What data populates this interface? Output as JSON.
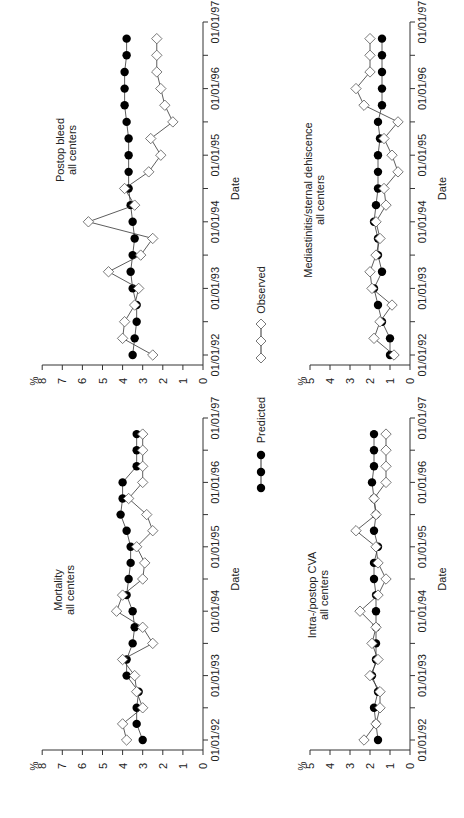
{
  "figure": {
    "orientation": "rotated-90-ccw",
    "legend": {
      "predicted_label": "Predicted",
      "observed_label": "Observed"
    },
    "xlabel": "Date",
    "ylabel": "%"
  },
  "chart_data": [
    {
      "type": "line",
      "title": "Postop bleed",
      "subtitle": "all centers",
      "xlabel": "Date",
      "ylabel": "%",
      "ylim": [
        0,
        8
      ],
      "yticks": [
        0,
        1,
        2,
        3,
        4,
        5,
        6,
        7,
        8
      ],
      "xticks": [
        "01/01/92",
        "01/01/93",
        "01/01/94",
        "01/01/95",
        "01/01/96",
        "01/01/97"
      ],
      "x": [
        "92Q1",
        "92Q2",
        "92Q3",
        "92Q4",
        "93Q1",
        "93Q2",
        "93Q3",
        "93Q4",
        "94Q1",
        "94Q2",
        "94Q3",
        "94Q4",
        "95Q1",
        "95Q2",
        "95Q3",
        "95Q4",
        "96Q1",
        "96Q2",
        "96Q3",
        "96Q4"
      ],
      "series": [
        {
          "name": "Predicted",
          "marker": "filled-circle",
          "values": [
            3.5,
            3.4,
            3.3,
            3.3,
            3.5,
            3.6,
            3.5,
            3.4,
            3.5,
            3.6,
            3.7,
            3.7,
            3.7,
            3.7,
            3.8,
            3.9,
            3.9,
            3.9,
            3.8,
            3.8
          ]
        },
        {
          "name": "Observed",
          "marker": "open-diamond",
          "values": [
            2.5,
            4.0,
            3.9,
            3.4,
            3.2,
            4.7,
            3.1,
            2.5,
            5.7,
            3.4,
            3.9,
            2.7,
            2.1,
            2.6,
            1.5,
            1.9,
            2.1,
            2.3,
            2.3,
            2.3
          ]
        }
      ]
    },
    {
      "type": "line",
      "title": "Mortality",
      "subtitle": "all centers",
      "xlabel": "Date",
      "ylabel": "%",
      "ylim": [
        0,
        8
      ],
      "yticks": [
        0,
        1,
        2,
        3,
        4,
        5,
        6,
        7,
        8
      ],
      "xticks": [
        "01/01/92",
        "01/01/93",
        "01/01/94",
        "01/01/95",
        "01/01/96",
        "01/01/97"
      ],
      "x": [
        "92Q1",
        "92Q2",
        "92Q3",
        "92Q4",
        "93Q1",
        "93Q2",
        "93Q3",
        "93Q4",
        "94Q1",
        "94Q2",
        "94Q3",
        "94Q4",
        "95Q1",
        "95Q2",
        "95Q3",
        "95Q4",
        "96Q1",
        "96Q2",
        "96Q3",
        "96Q4"
      ],
      "series": [
        {
          "name": "Predicted",
          "marker": "filled-circle",
          "values": [
            3.0,
            3.3,
            3.3,
            3.2,
            3.8,
            3.8,
            3.5,
            3.4,
            3.5,
            3.8,
            3.7,
            3.6,
            3.6,
            3.8,
            4.1,
            4.0,
            4.0,
            3.3,
            3.3,
            3.3
          ]
        },
        {
          "name": "Observed",
          "marker": "open-diamond",
          "values": [
            3.8,
            4.0,
            3.0,
            3.3,
            3.4,
            4.0,
            2.5,
            3.0,
            4.3,
            4.0,
            3.0,
            2.9,
            3.3,
            2.5,
            2.8,
            3.7,
            3.0,
            3.0,
            3.0,
            3.0
          ]
        }
      ]
    },
    {
      "type": "line",
      "title": "Mediastinitis/sternal dehiscence",
      "subtitle": "all centers",
      "xlabel": "Date",
      "ylabel": "%",
      "ylim": [
        0,
        5
      ],
      "yticks": [
        0,
        1,
        2,
        3,
        4,
        5
      ],
      "xticks": [
        "01/01/92",
        "01/01/93",
        "01/01/94",
        "01/01/95",
        "01/01/96",
        "01/01/97"
      ],
      "x": [
        "92Q1",
        "92Q2",
        "92Q3",
        "92Q4",
        "93Q1",
        "93Q2",
        "93Q3",
        "93Q4",
        "94Q1",
        "94Q2",
        "94Q3",
        "94Q4",
        "95Q1",
        "95Q2",
        "95Q3",
        "95Q4",
        "96Q1",
        "96Q2",
        "96Q3",
        "96Q4"
      ],
      "series": [
        {
          "name": "Predicted",
          "marker": "filled-circle",
          "values": [
            1.0,
            1.0,
            1.4,
            1.6,
            1.8,
            1.4,
            1.6,
            1.6,
            1.8,
            1.7,
            1.6,
            1.6,
            1.6,
            1.5,
            1.6,
            1.4,
            1.4,
            1.4,
            1.4,
            1.4
          ]
        },
        {
          "name": "Observed",
          "marker": "open-diamond",
          "values": [
            0.8,
            1.8,
            1.5,
            0.9,
            1.9,
            2.0,
            1.7,
            1.5,
            1.7,
            1.2,
            1.3,
            0.6,
            0.9,
            1.3,
            0.6,
            2.3,
            2.7,
            2.0,
            2.0,
            2.0
          ]
        }
      ]
    },
    {
      "type": "line",
      "title": "Intra-/postop CVA",
      "subtitle": "all centers",
      "xlabel": "Date",
      "ylabel": "%",
      "ylim": [
        0,
        5
      ],
      "yticks": [
        0,
        1,
        2,
        3,
        4,
        5
      ],
      "xticks": [
        "01/01/92",
        "01/01/93",
        "01/01/94",
        "01/01/95",
        "01/01/96",
        "01/01/97"
      ],
      "x": [
        "92Q1",
        "92Q2",
        "92Q3",
        "92Q4",
        "93Q1",
        "93Q2",
        "93Q3",
        "93Q4",
        "94Q1",
        "94Q2",
        "94Q3",
        "94Q4",
        "95Q1",
        "95Q2",
        "95Q3",
        "95Q4",
        "96Q1",
        "96Q2",
        "96Q3",
        "96Q4"
      ],
      "series": [
        {
          "name": "Predicted",
          "marker": "filled-circle",
          "values": [
            1.6,
            1.7,
            1.8,
            1.6,
            1.9,
            1.7,
            1.7,
            1.7,
            1.7,
            1.7,
            1.8,
            1.8,
            1.6,
            1.8,
            1.7,
            1.8,
            1.9,
            1.8,
            1.8,
            1.8
          ]
        },
        {
          "name": "Observed",
          "marker": "open-diamond",
          "values": [
            2.3,
            1.7,
            1.5,
            1.5,
            2.0,
            1.6,
            1.9,
            1.7,
            2.5,
            1.6,
            1.2,
            1.6,
            1.7,
            2.7,
            1.7,
            1.8,
            1.2,
            1.2,
            1.2,
            1.2
          ]
        }
      ]
    }
  ]
}
